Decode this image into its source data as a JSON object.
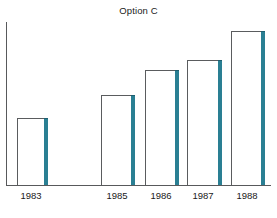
{
  "chart_data": {
    "type": "bar",
    "title": "Option C",
    "xlabel": "",
    "ylabel": "",
    "categories": [
      "1983",
      "1985",
      "1986",
      "1987",
      "1988"
    ],
    "values": [
      67,
      90,
      115,
      125,
      154
    ],
    "ylim": [
      0,
      163
    ],
    "grid": false,
    "legend": null,
    "axis_ticks_y": [],
    "bars": [
      {
        "category": "1983",
        "value": 67,
        "left": 17,
        "width": 29,
        "top": 118,
        "height": 67,
        "label_center": 31
      },
      {
        "category": "1985",
        "value": 90,
        "left": 101,
        "width": 32,
        "top": 95,
        "height": 90,
        "label_center": 117
      },
      {
        "category": "1986",
        "value": 115,
        "left": 145,
        "width": 32,
        "top": 70,
        "height": 115,
        "label_center": 161
      },
      {
        "category": "1987",
        "value": 125,
        "left": 187,
        "width": 33,
        "top": 60,
        "height": 125,
        "label_center": 203
      },
      {
        "category": "1988",
        "value": 154,
        "left": 231,
        "width": 32,
        "top": 31,
        "height": 154,
        "label_center": 247
      }
    ]
  },
  "colors": {
    "bar_fill": "#ffffff",
    "bar_outline": "#5a5c5e",
    "bar_shadow": "#2a7f93",
    "axis": "#58595b",
    "text": "#1a1a1a",
    "background": "#ffffff"
  }
}
